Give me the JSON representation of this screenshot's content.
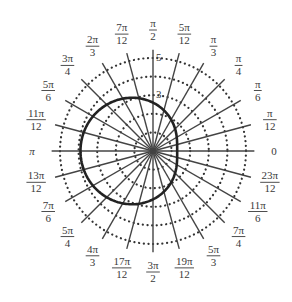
{
  "chart_data": {
    "type": "polar",
    "title": "",
    "center": [
      153,
      151
    ],
    "unit_px": 18.6,
    "rings": [
      1,
      2,
      3,
      4,
      5
    ],
    "ring_style": "dotted",
    "radial_line_extent": 5.45,
    "radial_labels": [
      {
        "value": 3,
        "text": "3"
      },
      {
        "value": 5,
        "text": "5"
      }
    ],
    "angle_labels": [
      {
        "angle_deg": 0,
        "num": "0",
        "den": ""
      },
      {
        "angle_deg": 15,
        "num": "π",
        "den": "12"
      },
      {
        "angle_deg": 30,
        "num": "π",
        "den": "6"
      },
      {
        "angle_deg": 45,
        "num": "π",
        "den": "4"
      },
      {
        "angle_deg": 60,
        "num": "π",
        "den": "3"
      },
      {
        "angle_deg": 75,
        "num": "5π",
        "den": "12"
      },
      {
        "angle_deg": 90,
        "num": "π",
        "den": "2"
      },
      {
        "angle_deg": 105,
        "num": "7π",
        "den": "12"
      },
      {
        "angle_deg": 120,
        "num": "2π",
        "den": "3"
      },
      {
        "angle_deg": 135,
        "num": "3π",
        "den": "4"
      },
      {
        "angle_deg": 150,
        "num": "5π",
        "den": "6"
      },
      {
        "angle_deg": 165,
        "num": "11π",
        "den": "12"
      },
      {
        "angle_deg": 180,
        "num": "π",
        "den": ""
      },
      {
        "angle_deg": 195,
        "num": "13π",
        "den": "12"
      },
      {
        "angle_deg": 210,
        "num": "7π",
        "den": "6"
      },
      {
        "angle_deg": 225,
        "num": "5π",
        "den": "4"
      },
      {
        "angle_deg": 240,
        "num": "4π",
        "den": "3"
      },
      {
        "angle_deg": 255,
        "num": "17π",
        "den": "12"
      },
      {
        "angle_deg": 270,
        "num": "3π",
        "den": "2"
      },
      {
        "angle_deg": 285,
        "num": "19π",
        "den": "12"
      },
      {
        "angle_deg": 300,
        "num": "5π",
        "den": "3"
      },
      {
        "angle_deg": 315,
        "num": "7π",
        "den": "4"
      },
      {
        "angle_deg": 330,
        "num": "11π",
        "den": "6"
      },
      {
        "angle_deg": 345,
        "num": "23π",
        "den": "12"
      }
    ],
    "label_radius_px": 121,
    "series": [
      {
        "name": "curve",
        "equation": "r = 1.3(2 - cos θ)",
        "a": 2.6,
        "b": -1.3,
        "theta_range": [
          0,
          6.2832
        ],
        "color": "#222222",
        "stroke_width": 2.6
      }
    ],
    "colors": {
      "grid_line": "#444444",
      "ring_dot": "#333333",
      "label": "#3a3a3a"
    }
  }
}
